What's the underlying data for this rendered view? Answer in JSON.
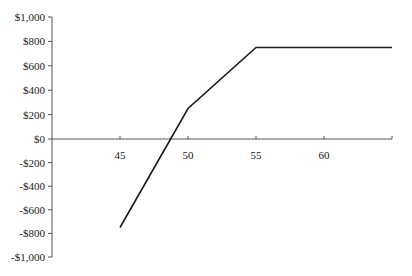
{
  "chart_data": {
    "type": "line",
    "title": "",
    "xlabel": "",
    "ylabel": "",
    "xlim": [
      40,
      65
    ],
    "ylim": [
      -1000,
      1000
    ],
    "grid": false,
    "legend": null,
    "x_ticks": [
      45,
      50,
      55,
      60
    ],
    "x_tick_labels": [
      "45",
      "50",
      "55",
      "60"
    ],
    "y_ticks": [
      1000,
      800,
      600,
      400,
      200,
      0,
      -200,
      -400,
      -600,
      -800,
      -1000
    ],
    "y_tick_labels": [
      "$1,000",
      "$800",
      "$600",
      "$400",
      "$200",
      "$0",
      "-$200",
      "-$400",
      "-$600",
      "-$800",
      "-$1,000"
    ],
    "series": [
      {
        "name": "Payoff",
        "x": [
          45,
          50,
          55,
          65
        ],
        "y": [
          -750,
          250,
          750,
          750
        ],
        "color": "#1a1a1a"
      }
    ]
  },
  "style": {
    "axis_color": "#555555",
    "line_color": "#1a1a1a",
    "text_color": "#1a1a1a"
  }
}
